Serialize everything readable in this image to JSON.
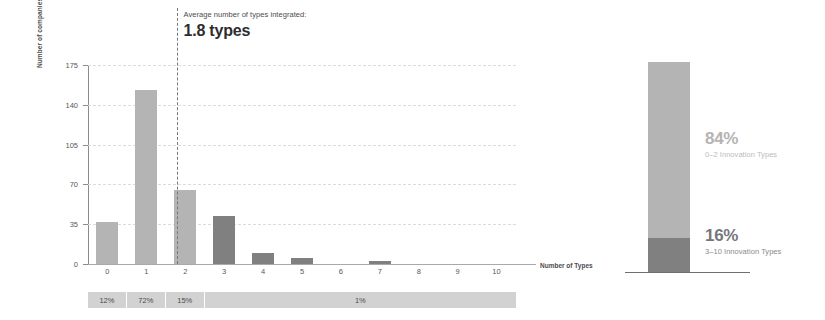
{
  "chart_data": [
    {
      "type": "bar",
      "title": "",
      "xlabel": "Number of Types",
      "ylabel": "Number of companies",
      "categories": [
        "0",
        "1",
        "2",
        "3",
        "4",
        "5",
        "6",
        "7",
        "8",
        "9",
        "10"
      ],
      "values": [
        37,
        153,
        65,
        42,
        10,
        5,
        0,
        3,
        0,
        0,
        0
      ],
      "bar_colors": [
        "#b4b4b4",
        "#b4b4b4",
        "#b4b4b4",
        "#808080",
        "#808080",
        "#808080",
        "#808080",
        "#808080",
        "#808080",
        "#808080",
        "#808080"
      ],
      "ylim": [
        0,
        175
      ],
      "yticks": [
        0,
        35,
        70,
        105,
        140,
        175
      ],
      "grid": true,
      "legend": "none",
      "annotations": {
        "average_line_x": 1.8,
        "average_caption": "Average number of types integrated:",
        "average_value": "1.8 types"
      },
      "percent_strip": [
        {
          "span": [
            "0"
          ],
          "label": "12%"
        },
        {
          "span": [
            "1"
          ],
          "label": "72%"
        },
        {
          "span": [
            "2"
          ],
          "label": "15%"
        },
        {
          "span": [
            "3",
            "4",
            "5",
            "6",
            "7",
            "8",
            "9",
            "10"
          ],
          "label": "1%"
        }
      ]
    },
    {
      "type": "bar",
      "subtype": "stacked",
      "title": "",
      "categories": [
        "All companies"
      ],
      "series": [
        {
          "name": "0–2 Innovation Types",
          "values": [
            84
          ],
          "color": "#b4b4b4",
          "label": "84%"
        },
        {
          "name": "3–10 Innovation Types",
          "values": [
            16
          ],
          "color": "#808080",
          "label": "16%"
        }
      ],
      "ylim": [
        0,
        100
      ],
      "grid": false,
      "legend": "inline-right"
    }
  ],
  "left_chart": {
    "y_axis_title": "Number of companies",
    "x_axis_title": "Number of Types",
    "y_tick_labels": [
      "175",
      "140",
      "105",
      "70",
      "35",
      "0"
    ],
    "x_tick_labels": [
      "0",
      "1",
      "2",
      "3",
      "4",
      "5",
      "6",
      "7",
      "8",
      "9",
      "10"
    ],
    "average": {
      "caption": "Average number of types integrated:",
      "value": "1.8 types"
    },
    "percent_segments": [
      {
        "label": "12%"
      },
      {
        "label": "72%"
      },
      {
        "label": "15%"
      },
      {
        "label": "1%"
      }
    ]
  },
  "right_chart": {
    "top_segment": {
      "percent": "84%",
      "description": "0–2 Innovation Types"
    },
    "bottom_segment": {
      "percent": "16%",
      "description": "3–10 Innovation Types"
    }
  },
  "colors": {
    "light_bar": "#b4b4b4",
    "dark_bar": "#808080",
    "grid": "#d9dde0",
    "strip": "#d2d2d2",
    "text": "#58585a"
  }
}
